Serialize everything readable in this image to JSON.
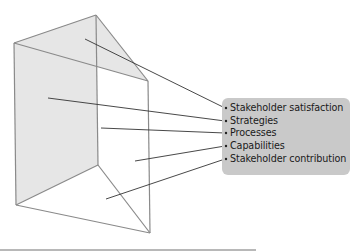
{
  "diagram": {
    "type": "performance-prism",
    "colors": {
      "shaded_face": "#e6e6e6",
      "edge": "#8a8a8a",
      "arrow": "#333333",
      "label_box": "#c9c9c9",
      "text": "#1a1a1a"
    },
    "labels": [
      {
        "text": "Stakeholder satisfaction",
        "face": "top"
      },
      {
        "text": "Strategies",
        "face": "left"
      },
      {
        "text": "Processes",
        "face": "front-edge"
      },
      {
        "text": "Capabilities",
        "face": "right"
      },
      {
        "text": "Stakeholder contribution",
        "face": "bottom"
      }
    ]
  }
}
